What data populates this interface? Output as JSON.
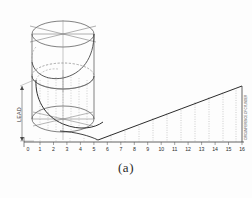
{
  "figure": {
    "caption": "(a)",
    "background_color": "#fdfdfd",
    "line_color": "#3a3a3a",
    "construction_color": "#6f6f6f",
    "dotted_color": "#8a8a8a"
  },
  "axis": {
    "name": "stretch-out-baseline",
    "tick_labels": [
      "1",
      "2",
      "3",
      "4",
      "5",
      "6",
      "7",
      "8",
      "9",
      "10",
      "11",
      "12",
      "13",
      "14",
      "15",
      "16"
    ],
    "extra_marks": [
      "8",
      "0",
      "3"
    ],
    "baseline_y": 142,
    "origin_label": "0"
  },
  "dimensions": {
    "left_vertical_label": "LEAD",
    "right_vertical_label": "CIRCUMFERENCE OF CYLINDER"
  },
  "upper_cylinder": {
    "name": "construction-cylinder",
    "division_count": 6,
    "note": "top ellipse divided into six equal parts by three diameters"
  },
  "lower_cylinder": {
    "name": "helix-cylinder",
    "note": "helix curve swept one full revolution, ordinates projected as dotted verticals"
  },
  "development": {
    "name": "helix-development",
    "note": "inclined straight line is the helix developed into a right triangle",
    "ordinate_count": 16
  },
  "chart_data": {
    "type": "line",
    "xlabel": "",
    "ylabel": "",
    "x": [
      0,
      1,
      2,
      3,
      4,
      5,
      6,
      7,
      8,
      9,
      10,
      11,
      12,
      13,
      14,
      15,
      16
    ],
    "categories": [
      "0",
      "1",
      "2",
      "3",
      "4",
      "5",
      "6",
      "7",
      "8",
      "9",
      "10",
      "11",
      "12",
      "13",
      "14",
      "15",
      "16"
    ],
    "series": [
      {
        "name": "developed helix",
        "values": [
          0,
          0,
          0,
          0,
          0,
          2.8,
          5.6,
          8.4,
          11.2,
          14.0,
          16.8,
          19.6,
          22.4,
          25.2,
          28.0,
          30.8,
          33.6
        ]
      }
    ],
    "xlim": [
      0,
      16
    ],
    "ylim": [
      0,
      34
    ],
    "grid": false,
    "legend": "none"
  }
}
